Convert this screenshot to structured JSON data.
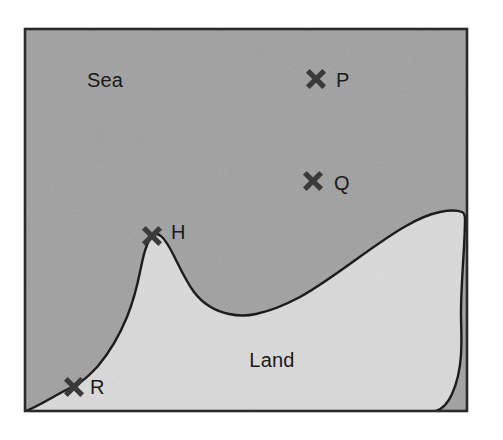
{
  "figure": {
    "name": "coastline-map",
    "frame": {
      "x": 25,
      "y": 29,
      "width": 442,
      "height": 382
    },
    "colors": {
      "sea_fill": "#a8a8a8",
      "land_fill": "#dcdcdc",
      "line": "#1c1c1c",
      "frame": "#2a2a2a",
      "marker": "#3a3a3a",
      "text": "#1a1a1a",
      "background": "#ffffff"
    },
    "region_labels": [
      {
        "id": "sea",
        "text": "Sea",
        "x": 105,
        "y": 87
      },
      {
        "id": "land",
        "text": "Land",
        "x": 272,
        "y": 367
      }
    ],
    "markers": [
      {
        "id": "P",
        "label": "P",
        "x": 316,
        "y": 79,
        "label_x": 336,
        "label_y": 87,
        "region": "sea"
      },
      {
        "id": "Q",
        "label": "Q",
        "x": 313,
        "y": 181,
        "label_x": 334,
        "label_y": 190,
        "region": "sea"
      },
      {
        "id": "H",
        "label": "H",
        "x": 152,
        "y": 236,
        "label_x": 171,
        "label_y": 239,
        "region": "coast"
      },
      {
        "id": "R",
        "label": "R",
        "x": 74,
        "y": 387,
        "label_x": 90,
        "label_y": 394,
        "region": "coast"
      }
    ],
    "coastline_path": "M 26,411 C 36,407 46,401 55,396 C 62,392 68,389 74,386 C 82,382 90,375 98,366 C 108,354 118,339 127,317 C 133,302 137,287 140,272 C 142,262 144,252 147,245 C 149,240 151,237 153,235 C 156,233 159,234 162,237 C 166,241 170,248 174,256 C 180,268 186,281 194,292 C 203,304 215,311 229,314 C 238,316 247,316 256,314 C 270,311 285,305 300,297 C 318,287 336,274 354,261 C 372,248 390,235 406,226 C 418,219 430,214 440,212 C 450,210 457,210 462,212 C 464,213 465,215 465,219 C 465,232 464,248 463,264 C 462,281 461,297 461,312 C 461,327 462,341 461,355 C 460,370 457,383 452,394 C 448,403 442,409 436,411"
  }
}
